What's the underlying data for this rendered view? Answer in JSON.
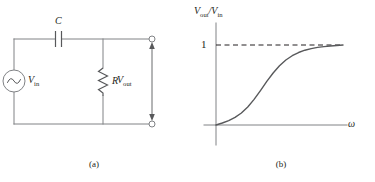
{
  "figure": {
    "ink_color": "#231f20",
    "wire_color": "#808285",
    "curve_color": "#58595b"
  },
  "panel_a": {
    "caption": "(a)",
    "name": "rc-high-pass-circuit",
    "components": {
      "capacitor_label": "C",
      "resistor_label": "R",
      "source_label_main": "V",
      "source_label_sub": "in",
      "output_label_main": "V",
      "output_label_sub": "out",
      "source_symbol": "sine-wave"
    }
  },
  "panel_b": {
    "caption": "(b)",
    "name": "frequency-response-plot",
    "y_axis_label_main": "V",
    "y_axis_label_sub_out": "out",
    "y_axis_label_divider": "/",
    "y_axis_label_sub_in": "in",
    "x_axis_label": "ω",
    "y_tick_label": "1",
    "asymptote_style": "dashed"
  },
  "chart_data": {
    "type": "line",
    "title": "",
    "xlabel": "ω",
    "ylabel": "Vout/Vin",
    "xlim": [
      0,
      10
    ],
    "ylim": [
      0,
      1.12
    ],
    "grid": false,
    "legend": null,
    "yticks": [
      1
    ],
    "ytick_labels": [
      "1"
    ],
    "xticks": [],
    "annotations": [
      {
        "type": "hline",
        "y": 1,
        "style": "dashed",
        "label": "1"
      }
    ],
    "series": [
      {
        "name": "Vout/Vin",
        "x": [
          0.0,
          0.5,
          1.0,
          1.5,
          2.0,
          2.5,
          3.0,
          3.5,
          4.0,
          4.5,
          5.0,
          5.5,
          6.0,
          6.5,
          7.0,
          7.5,
          8.0,
          8.5,
          9.0,
          9.5,
          10.0
        ],
        "y": [
          0.0,
          0.025,
          0.055,
          0.095,
          0.15,
          0.225,
          0.32,
          0.43,
          0.545,
          0.65,
          0.74,
          0.812,
          0.866,
          0.906,
          0.935,
          0.955,
          0.97,
          0.98,
          0.988,
          0.994,
          1.0
        ]
      }
    ]
  }
}
